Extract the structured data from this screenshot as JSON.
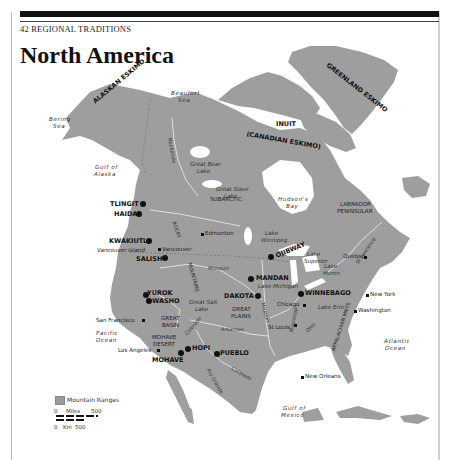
{
  "header": {
    "running_head": "42  REGIONAL TRADITIONS",
    "title": "North America"
  },
  "colors": {
    "land": "#9e9e9e",
    "water": "#ffffff",
    "rules": "#111111"
  },
  "map": {
    "tribes": {
      "alaskan_eskimo": "ALASKAN ESKIMO",
      "greenland_eskimo": "GREENLAND ESKIMO",
      "inuit": "INUIT",
      "canadian_eskimo": "(CANADIAN ESKIMO)",
      "tlingit": "TLINGIT",
      "haida": "HAIDA",
      "kwakiutl": "KWAKIUTL",
      "salish": "SALISH",
      "ojibway": "OJIBWAY",
      "mandan": "MANDAN",
      "dakota": "DAKOTA",
      "winnebago": "WINNEBAGO",
      "yurok": "YUROK",
      "washo": "WASHO",
      "hopi": "HOPI",
      "pueblo": "PUEBLO",
      "mohave": "MOHAVE"
    },
    "regions": {
      "subarctic": "SUBARCTIC",
      "labrador": "LABRADOR",
      "peninsular": "PENINSULAR",
      "great_plains_1": "GREAT",
      "great_plains_2": "PLAINS",
      "great_basin_1": "GREAT",
      "great_basin_2": "BASIN",
      "mohave_desert_1": "MOHAVE",
      "mohave_desert_2": "DESERT",
      "rocky": "ROCKY",
      "mountains": "MOUNTAINS",
      "appalachian": "APPALACHIAN MNTS"
    },
    "water": {
      "beaufort_1": "Beaufort",
      "beaufort_2": "Sea",
      "bering_1": "Bering",
      "bering_2": "Sea",
      "gulf_alaska_1": "Gulf of",
      "gulf_alaska_2": "Alaska",
      "hudson_1": "Hudson's",
      "hudson_2": "Bay",
      "great_bear_1": "Great Bear",
      "great_bear_2": "Lake",
      "great_slave_1": "Great Slave",
      "great_slave_2": "Lake",
      "lake_winnipeg_1": "Lake",
      "lake_winnipeg_2": "Winnipeg",
      "lake_superior_1": "Lake",
      "lake_superior_2": "Superior",
      "lake_huron_1": "Lake",
      "lake_huron_2": "Huron",
      "lake_michigan": "Lake Michigan",
      "lake_erie": "Lake Erie",
      "great_salt_1": "Great Salt",
      "great_salt_2": "Lake",
      "pacific_1": "Pacific",
      "pacific_2": "Ocean",
      "atlantic_1": "Atlantic",
      "atlantic_2": "Ocean",
      "gulf_mexico_1": "Gulf of",
      "gulf_mexico_2": "Mexico"
    },
    "rivers": {
      "mackenzie": "Mackenzie",
      "missouri": "Missouri",
      "missouri2": "Missouri",
      "colorado": "Colorado",
      "colorado2": "Colorado",
      "arkansas": "Arkansas",
      "mississippi": "Mississippi",
      "ohio": "Ohio",
      "rio_grande": "Rio Grande",
      "st_lawrence": "St Lawrence"
    },
    "cities": {
      "edmonton": "Edmonton",
      "vancouver": "Vancouver",
      "vancouver_island": "Vancouver Island",
      "quebec": "Quebec",
      "chicago": "Chicago",
      "new_york": "New York",
      "washington": "Washington",
      "st_louis": "St Louis",
      "san_francisco": "San Francisco",
      "los_angeles": "Los Angeles",
      "new_orleans": "New Orleans"
    }
  },
  "legend": {
    "mountain_ranges": "Mountain Ranges",
    "miles_zero": "0",
    "miles_label": "Miles",
    "miles_max": "500",
    "km_zero": "0",
    "km_label": "Km",
    "km_max": "500"
  }
}
